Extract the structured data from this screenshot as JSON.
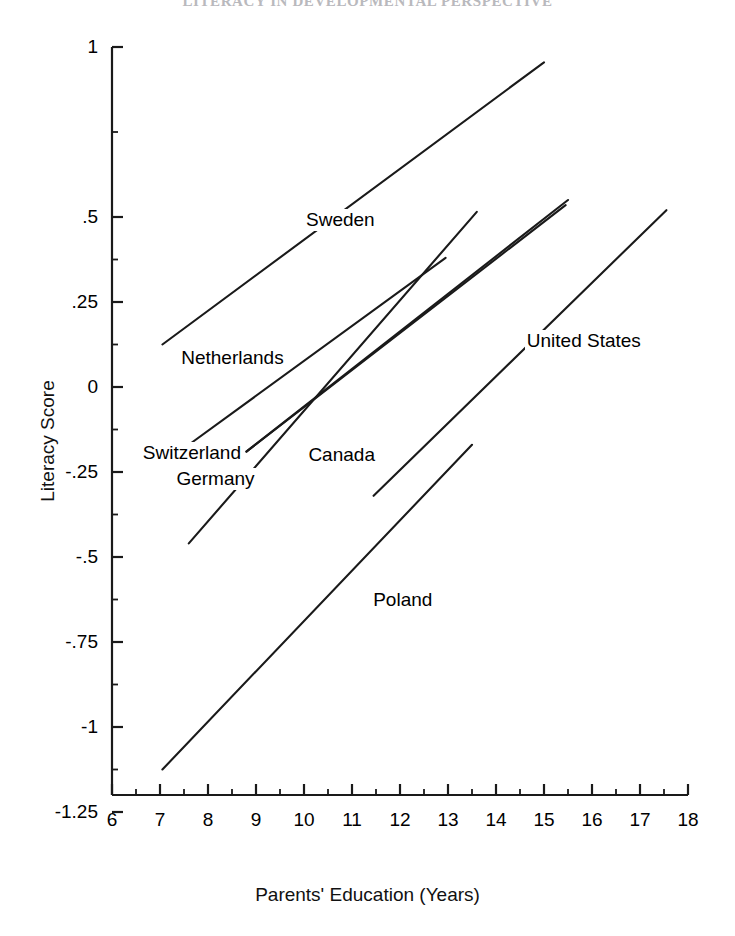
{
  "running_head": {
    "text": "LITERACY IN DEVELOPMENTAL PERSPECTIVE"
  },
  "figure": {
    "background_color": "#ffffff",
    "line_color": "#1a1a1a"
  },
  "chart_data": {
    "type": "line",
    "title": "",
    "subtitle": "",
    "xlabel": "Parents' Education (Years)",
    "ylabel": "Literacy Score",
    "xlim": [
      6,
      18
    ],
    "ylim": [
      -1.4,
      1.0
    ],
    "grid": false,
    "legend_position": "inline-labels",
    "x_ticks": [
      6,
      7,
      8,
      9,
      10,
      11,
      12,
      13,
      14,
      15,
      16,
      17,
      18
    ],
    "x_tick_labels": [
      "6",
      "7",
      "8",
      "9",
      "10",
      "11",
      "12",
      "13",
      "14",
      "15",
      "16",
      "17",
      "18"
    ],
    "x_minor_ticks": [
      6.5,
      7.5,
      8.5,
      9.5,
      10.5,
      11.5,
      12.5,
      13.5,
      14.5,
      15.5,
      16.5,
      17.5
    ],
    "y_ticks": [
      1,
      0.5,
      0.25,
      0,
      -0.25,
      -0.5,
      -0.75,
      -1,
      -1.25
    ],
    "y_tick_labels": [
      "1",
      ".5",
      ".25",
      "0",
      "-.25",
      "-.5",
      "-.75",
      "-1",
      "-1.25"
    ],
    "y_minor_ticks": [
      0.75,
      0.375,
      0.125,
      -0.125,
      -0.375,
      -0.625,
      -0.875,
      -1.125
    ],
    "series": [
      {
        "name": "Sweden",
        "x": [
          7.05,
          15.0
        ],
        "y": [
          0.125,
          0.955
        ],
        "label_x": 10.0,
        "label_y": 0.49
      },
      {
        "name": "Netherlands",
        "x": [
          7.6,
          13.6
        ],
        "y": [
          -0.46,
          0.515
        ],
        "label_x": 7.4,
        "label_y": 0.085
      },
      {
        "name": "Switzerland",
        "x": [
          8.8,
          15.5
        ],
        "y": [
          -0.19,
          0.55
        ],
        "label_x": 6.6,
        "label_y": -0.195
      },
      {
        "name": "Germany",
        "x": [
          8.8,
          15.45
        ],
        "y": [
          -0.19,
          0.535
        ],
        "label_x": 7.3,
        "label_y": -0.27
      },
      {
        "name": "Canada",
        "x": [
          7.55,
          12.95
        ],
        "y": [
          -0.175,
          0.38
        ],
        "label_x": 10.05,
        "label_y": -0.2
      },
      {
        "name": "United States",
        "x": [
          11.45,
          17.55
        ],
        "y": [
          -0.32,
          0.52
        ],
        "label_x": 14.6,
        "label_y": 0.135
      },
      {
        "name": "Poland",
        "x": [
          7.05,
          13.5
        ],
        "y": [
          -1.125,
          -0.17
        ],
        "label_x": 11.4,
        "label_y": -0.625
      }
    ]
  }
}
